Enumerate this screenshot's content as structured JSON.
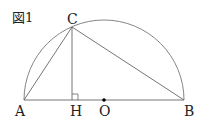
{
  "figure": {
    "label": "図1",
    "type": "semicircle-geometry",
    "colors": {
      "line": "#666666",
      "text": "#222222",
      "point": "#000000"
    },
    "points": {
      "A": {
        "label": "A",
        "x": 24,
        "y": 100
      },
      "B": {
        "label": "B",
        "x": 184,
        "y": 100
      },
      "O": {
        "label": "O",
        "x": 104,
        "y": 100
      },
      "C": {
        "label": "C",
        "x": 72,
        "y": 27
      },
      "H": {
        "label": "H",
        "x": 72,
        "y": 100
      }
    },
    "segments": [
      "AB",
      "AC",
      "BC",
      "CH"
    ],
    "right_angle_at": "H",
    "arc": "semicircle with diameter AB, center O"
  }
}
